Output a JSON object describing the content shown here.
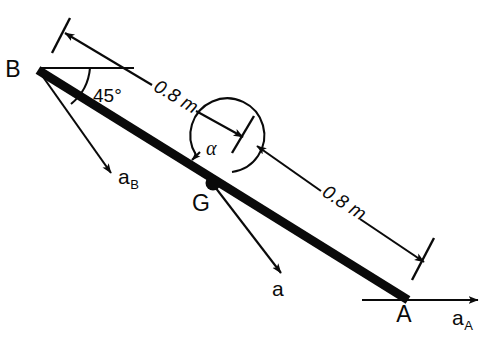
{
  "figure": {
    "type": "engineering-mechanics-diagram",
    "background_color": "#ffffff",
    "ink_color": "#0a0a0a"
  },
  "points": [
    {
      "id": "B",
      "label": "B",
      "x": 38,
      "y": 70,
      "role": "upper-left-end-of-bar"
    },
    {
      "id": "G",
      "label": "G",
      "x": 213,
      "y": 183,
      "role": "mass-center"
    },
    {
      "id": "A",
      "label": "A",
      "x": 405,
      "y": 301,
      "role": "lower-right-end-of-bar"
    }
  ],
  "bar": {
    "name": "rigid-bar-AB",
    "from": "B",
    "to": "A",
    "stroke_width": 9
  },
  "angles": [
    {
      "id": "angle-45",
      "label": "45°",
      "at": "B",
      "between": "horizontal-reference-and-bar"
    },
    {
      "id": "angle-alpha",
      "label": "α",
      "at": "G",
      "between": "bar-and-dimension-line"
    }
  ],
  "dimensions": [
    {
      "id": "dim-BG",
      "label": "0.8 m",
      "from": "B",
      "to": "G",
      "value": 0.8,
      "unit": "m"
    },
    {
      "id": "dim-GA",
      "label": "0.8 m",
      "from": "G",
      "to": "A",
      "value": 0.8,
      "unit": "m"
    }
  ],
  "vectors": [
    {
      "id": "a_B",
      "label": "a",
      "subscript": "B",
      "origin": "B",
      "direction": "down-right",
      "meaning": "acceleration of point B"
    },
    {
      "id": "a_G",
      "label": "a",
      "subscript": "",
      "origin": "G",
      "direction": "down-right",
      "meaning": "acceleration of mass center G"
    },
    {
      "id": "a_A",
      "label": "a",
      "subscript": "A",
      "origin": "A",
      "direction": "right-horizontal",
      "meaning": "acceleration of point A"
    }
  ],
  "labels": {
    "point_B": "B",
    "point_G": "G",
    "point_A": "A",
    "angle_45": "45°",
    "angle_alpha": "α",
    "dim_upper": "0.8 m",
    "dim_lower": "0.8 m",
    "vec_aB_base": "a",
    "vec_aB_sub": "B",
    "vec_aG_base": "a",
    "vec_aA_base": "a",
    "vec_aA_sub": "A"
  }
}
